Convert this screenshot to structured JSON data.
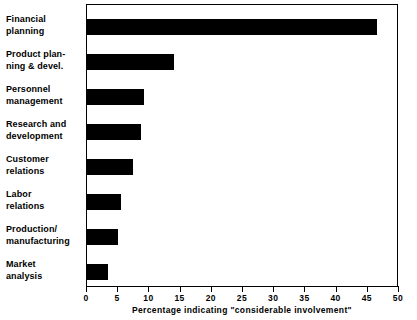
{
  "chart_data": {
    "type": "bar",
    "orientation": "horizontal",
    "title": "",
    "xlabel": "Percentage indicating \"considerable involvement\"",
    "ylabel": "",
    "xlim": [
      0,
      50
    ],
    "xticks": [
      0,
      5,
      10,
      15,
      20,
      25,
      30,
      35,
      40,
      45,
      50
    ],
    "xtick_labels": [
      "0",
      "5",
      "10",
      "15",
      "20",
      "25",
      "30",
      "35",
      "40",
      "45",
      "50"
    ],
    "grid": false,
    "legend": null,
    "bar_color": "#000000",
    "background_color": "#ffffff",
    "frame_color": "#000000",
    "categories": [
      "Financial\nplanning",
      "Product plan-\nning & devel.",
      "Personnel\nmanagement",
      "Research and\ndevelopment",
      "Customer\nrelations",
      "Labor\nrelations",
      "Production/\nmanufacturing",
      "Market\nanalysis"
    ],
    "values": [
      46.5,
      14.0,
      9.2,
      8.6,
      7.3,
      5.4,
      5.0,
      3.3
    ]
  }
}
